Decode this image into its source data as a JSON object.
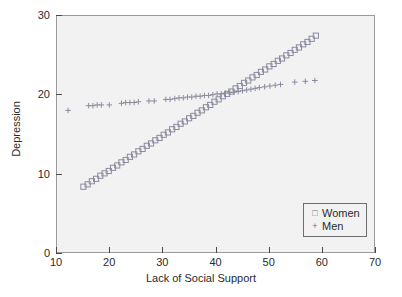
{
  "chart_data": {
    "type": "scatter",
    "title": "",
    "xlabel": "Lack of Social Support",
    "ylabel": "Depression",
    "xlim": [
      10,
      70
    ],
    "ylim": [
      0,
      30
    ],
    "xticks": [
      10,
      20,
      30,
      40,
      50,
      60,
      70
    ],
    "yticks": [
      0,
      10,
      20,
      30
    ],
    "grid": false,
    "legend_position": "bottom-right",
    "series": [
      {
        "name": "Women",
        "marker": "square",
        "color": "#8a8a9e",
        "points": [
          [
            15.0,
            8.3
          ],
          [
            15.8,
            8.6
          ],
          [
            16.6,
            9.0
          ],
          [
            17.4,
            9.3
          ],
          [
            18.2,
            9.7
          ],
          [
            19.0,
            10.0
          ],
          [
            19.8,
            10.3
          ],
          [
            20.6,
            10.7
          ],
          [
            21.4,
            11.0
          ],
          [
            22.2,
            11.4
          ],
          [
            23.0,
            11.7
          ],
          [
            23.8,
            12.1
          ],
          [
            24.6,
            12.4
          ],
          [
            25.4,
            12.8
          ],
          [
            26.2,
            13.1
          ],
          [
            27.0,
            13.5
          ],
          [
            27.8,
            13.8
          ],
          [
            28.6,
            14.2
          ],
          [
            29.4,
            14.5
          ],
          [
            30.2,
            14.9
          ],
          [
            31.0,
            15.2
          ],
          [
            31.8,
            15.6
          ],
          [
            32.6,
            15.9
          ],
          [
            33.4,
            16.3
          ],
          [
            34.2,
            16.6
          ],
          [
            35.0,
            17.0
          ],
          [
            35.8,
            17.3
          ],
          [
            36.6,
            17.7
          ],
          [
            37.4,
            18.0
          ],
          [
            38.2,
            18.4
          ],
          [
            39.0,
            18.7
          ],
          [
            39.8,
            19.1
          ],
          [
            40.6,
            19.4
          ],
          [
            41.4,
            19.8
          ],
          [
            42.2,
            20.1
          ],
          [
            43.0,
            20.4
          ],
          [
            43.8,
            20.8
          ],
          [
            44.6,
            21.1
          ],
          [
            45.4,
            21.5
          ],
          [
            46.2,
            21.8
          ],
          [
            47.0,
            22.2
          ],
          [
            47.8,
            22.5
          ],
          [
            48.6,
            22.9
          ],
          [
            49.4,
            23.2
          ],
          [
            50.2,
            23.6
          ],
          [
            51.0,
            23.9
          ],
          [
            51.8,
            24.3
          ],
          [
            52.6,
            24.6
          ],
          [
            53.4,
            25.0
          ],
          [
            54.2,
            25.3
          ],
          [
            55.0,
            25.7
          ],
          [
            55.8,
            26.0
          ],
          [
            56.6,
            26.4
          ],
          [
            57.4,
            26.7
          ],
          [
            58.2,
            27.1
          ],
          [
            59.0,
            27.5
          ]
        ]
      },
      {
        "name": "Men",
        "marker": "plus",
        "color": "#8a8a9e",
        "points": [
          [
            12.1,
            18.0
          ],
          [
            16.0,
            18.6
          ],
          [
            16.8,
            18.6
          ],
          [
            17.6,
            18.7
          ],
          [
            18.4,
            18.7
          ],
          [
            19.9,
            18.7
          ],
          [
            22.2,
            18.9
          ],
          [
            23.0,
            19.0
          ],
          [
            23.8,
            19.0
          ],
          [
            24.6,
            19.0
          ],
          [
            25.4,
            19.1
          ],
          [
            27.4,
            19.2
          ],
          [
            28.4,
            19.2
          ],
          [
            30.6,
            19.4
          ],
          [
            31.4,
            19.4
          ],
          [
            32.3,
            19.5
          ],
          [
            33.1,
            19.6
          ],
          [
            33.9,
            19.6
          ],
          [
            34.7,
            19.7
          ],
          [
            35.5,
            19.7
          ],
          [
            36.3,
            19.8
          ],
          [
            37.1,
            19.8
          ],
          [
            37.9,
            19.9
          ],
          [
            38.7,
            19.9
          ],
          [
            39.5,
            20.0
          ],
          [
            40.3,
            20.1
          ],
          [
            41.1,
            20.1
          ],
          [
            41.9,
            20.2
          ],
          [
            42.7,
            20.3
          ],
          [
            43.5,
            20.3
          ],
          [
            44.3,
            20.4
          ],
          [
            45.1,
            20.5
          ],
          [
            45.9,
            20.6
          ],
          [
            46.7,
            20.7
          ],
          [
            47.5,
            20.8
          ],
          [
            48.3,
            20.9
          ],
          [
            49.3,
            21.0
          ],
          [
            50.3,
            21.1
          ],
          [
            51.3,
            21.2
          ],
          [
            52.3,
            21.3
          ],
          [
            55.0,
            21.6
          ],
          [
            57.0,
            21.7
          ],
          [
            58.8,
            21.8
          ]
        ]
      }
    ]
  },
  "legend": {
    "items": [
      {
        "label": "Women",
        "glyph": "square-marker"
      },
      {
        "label": "Men",
        "glyph": "plus-marker"
      }
    ]
  },
  "colors": {
    "marker": "#8a8a9e",
    "axis": "#4a4a4a",
    "text": "#2b2b2b",
    "plot_background": "#f2f2f2",
    "page_background": "#ffffff"
  }
}
